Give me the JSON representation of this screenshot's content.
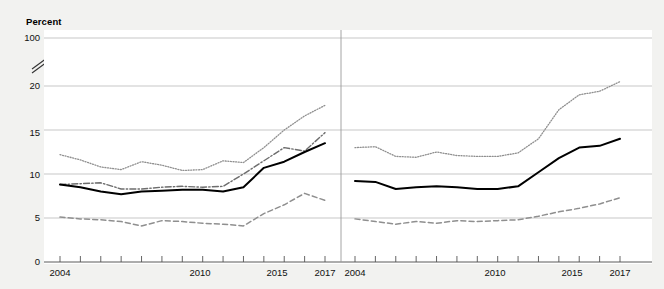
{
  "figure": {
    "y_axis_title": "Percent",
    "background_color": "#f2f2f0",
    "plot_background_color": "#ffffff",
    "gridline_color": "#b9b9b9",
    "axis_break_icon": "axis-break-slashes"
  },
  "y_axis": {
    "tick_labels": [
      "100",
      "20",
      "15",
      "10",
      "5",
      "0"
    ],
    "broken_between": [
      "20",
      "100"
    ],
    "min": 0,
    "max": 20
  },
  "panels": [
    {
      "id": "age",
      "title": "Age",
      "x_tick_labels": [
        "2004",
        "2010",
        "2015",
        "2017"
      ],
      "x_min": 2004,
      "x_max": 2017
    },
    {
      "id": "gender",
      "title": "Gender",
      "x_tick_labels": [
        "2004",
        "2010",
        "2015",
        "2017"
      ],
      "x_min": 2004,
      "x_max": 2017
    }
  ],
  "series_labels": {
    "ages_16_17": "Ages 16–17",
    "ages_14_15": "Ages 14–15",
    "total_age": "Total",
    "ages_12_13": "Ages 12–13",
    "female": "Female",
    "total_gender": "Total",
    "male": "Male"
  },
  "chart_data": {
    "type": "line",
    "title": "",
    "subtitle": "",
    "xlabel": "",
    "ylabel": "Percent",
    "ylim": [
      0,
      20
    ],
    "y_ticks": [
      0,
      5,
      10,
      15,
      20
    ],
    "y_axis_broken_top_label": "100",
    "grid": true,
    "legend": "inline-labels",
    "panels": [
      {
        "name": "Age",
        "x": [
          2004,
          2005,
          2006,
          2007,
          2008,
          2009,
          2010,
          2011,
          2012,
          2013,
          2014,
          2015,
          2016,
          2017
        ],
        "xlim": [
          2004,
          2017
        ],
        "series": [
          {
            "name": "Ages 16–17",
            "style": "dotted",
            "values": [
              12.2,
              11.6,
              10.8,
              10.5,
              11.4,
              11.0,
              10.4,
              10.5,
              11.5,
              11.3,
              13.0,
              15.0,
              16.6,
              17.8
            ]
          },
          {
            "name": "Ages 14–15",
            "style": "dash-dot",
            "values": [
              8.8,
              8.9,
              9.0,
              8.3,
              8.3,
              8.5,
              8.6,
              8.5,
              8.6,
              10.0,
              11.5,
              13.0,
              12.6,
              14.7
            ]
          },
          {
            "name": "Total",
            "style": "solid",
            "values": [
              8.8,
              8.5,
              8.0,
              7.7,
              8.0,
              8.1,
              8.2,
              8.2,
              8.0,
              8.5,
              10.7,
              11.4,
              12.5,
              13.5
            ]
          },
          {
            "name": "Ages 12–13",
            "style": "dashed",
            "values": [
              5.1,
              4.9,
              4.8,
              4.6,
              4.1,
              4.7,
              4.6,
              4.4,
              4.3,
              4.1,
              5.5,
              6.5,
              7.8,
              7.0
            ]
          }
        ]
      },
      {
        "name": "Gender",
        "x": [
          2004,
          2005,
          2006,
          2007,
          2008,
          2009,
          2010,
          2011,
          2012,
          2013,
          2014,
          2015,
          2016,
          2017
        ],
        "xlim": [
          2004,
          2017
        ],
        "series": [
          {
            "name": "Female",
            "style": "dotted",
            "values": [
              13.0,
              13.1,
              12.0,
              11.9,
              12.5,
              12.1,
              12.0,
              12.0,
              12.4,
              14.0,
              17.3,
              19.0,
              19.4,
              20.5
            ]
          },
          {
            "name": "Total",
            "style": "solid",
            "values": [
              9.2,
              9.1,
              8.3,
              8.5,
              8.6,
              8.5,
              8.3,
              8.3,
              8.6,
              10.2,
              11.8,
              13.0,
              13.2,
              14.0
            ]
          },
          {
            "name": "Male",
            "style": "dashed",
            "values": [
              4.9,
              4.6,
              4.3,
              4.6,
              4.4,
              4.7,
              4.6,
              4.7,
              4.8,
              5.2,
              5.7,
              6.1,
              6.6,
              7.3
            ]
          }
        ]
      }
    ]
  }
}
